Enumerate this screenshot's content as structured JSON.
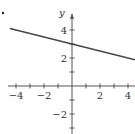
{
  "chart_data": {
    "type": "line",
    "title": "",
    "xlabel": "",
    "ylabel": "y",
    "xlim": [
      -4.5,
      4.5
    ],
    "ylim": [
      -3.4,
      5.5
    ],
    "grid": false,
    "x_ticks": [
      -4,
      -3,
      -2,
      -1,
      1,
      2,
      3,
      4
    ],
    "x_tick_labels": [
      "-4",
      "-2",
      "2",
      "4"
    ],
    "x_tick_label_values": [
      -4,
      -2,
      2,
      4
    ],
    "y_ticks": [
      -3,
      -2,
      -1,
      1,
      2,
      3,
      4
    ],
    "y_tick_labels": [
      "4",
      "2",
      "-2"
    ],
    "y_tick_label_values": [
      4,
      2,
      -2
    ],
    "series": [
      {
        "name": "line",
        "equation": "y = -x/4 + 3",
        "x": [
          -4.43,
          4.5
        ],
        "y": [
          4.11,
          1.875
        ],
        "color": "#444444"
      }
    ],
    "annotations": [
      "y"
    ],
    "marker": "."
  },
  "colors": {
    "axis": "#555555",
    "line": "#444444",
    "text": "#333333"
  }
}
